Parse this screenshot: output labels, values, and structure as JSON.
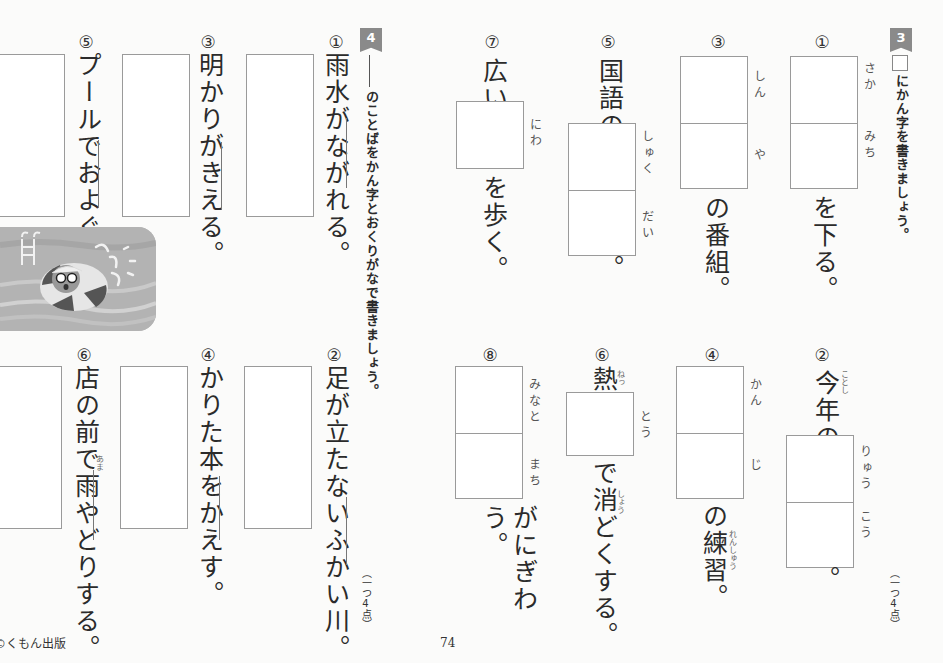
{
  "page": {
    "number": "74",
    "publisher": "©くもん出版"
  },
  "section3": {
    "badge": "3",
    "instruction": "にかん字を書きましょう。",
    "points": "（一つ4点）",
    "questions": [
      {
        "num": "①",
        "before": "",
        "furigana": [
          "さか",
          "みち"
        ],
        "after": "を下る。"
      },
      {
        "num": "②",
        "before": "今年の",
        "before_ruby": "ことし",
        "furigana": [
          "りゅう",
          "こう"
        ],
        "after": "。"
      },
      {
        "num": "③",
        "before": "",
        "furigana": [
          "しん",
          "や"
        ],
        "after": "の番組。"
      },
      {
        "num": "④",
        "before": "",
        "furigana": [
          "かん",
          "じ"
        ],
        "after": "の練習。",
        "after_ruby": "れんしゅう"
      },
      {
        "num": "⑤",
        "before": "国語の",
        "furigana": [
          "しゅく",
          "だい"
        ],
        "after": "。"
      },
      {
        "num": "⑥",
        "before": "熱",
        "before_ruby": "ねっ",
        "furigana": [
          "とう"
        ],
        "after": "で消どくする。",
        "after_ruby": "しょう"
      },
      {
        "num": "⑦",
        "before": "広い",
        "furigana": [
          "にわ"
        ],
        "after": "を歩く。"
      },
      {
        "num": "⑧",
        "before": "",
        "furigana": [
          "みなと",
          "まち"
        ],
        "after": "がにぎわう。"
      }
    ]
  },
  "section4": {
    "badge": "4",
    "instruction": "のことばをかん字とおくりがなで書きましょう。",
    "points": "（一つ4点）",
    "questions": [
      {
        "num": "①",
        "sentence": "雨水がながれる。",
        "underlined": "ながれる"
      },
      {
        "num": "②",
        "sentence": "足が立たないふかい川。",
        "underlined": "ふかい"
      },
      {
        "num": "③",
        "sentence": "明かりがきえる。",
        "underlined": "きえる"
      },
      {
        "num": "④",
        "sentence": "かりた本をかえす。",
        "underlined": "かえす"
      },
      {
        "num": "⑤",
        "sentence": "プールでおよぐ。",
        "underlined": "およぐ"
      },
      {
        "num": "⑥",
        "sentence": "店の前で雨やどりする。",
        "underlined": "やどり",
        "ruby": "あま"
      }
    ]
  },
  "illustration": {
    "description": "child-in-swim-ring-illustration"
  }
}
